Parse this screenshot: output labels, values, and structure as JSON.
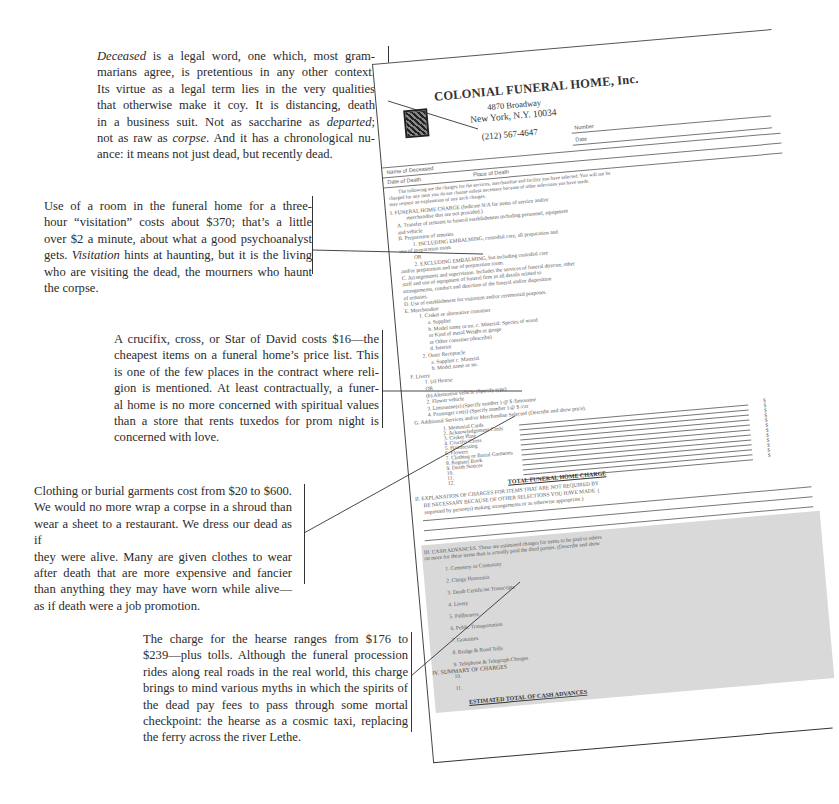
{
  "annotations": [
    {
      "id": "deceased",
      "lines": [
        [
          "<em>Deceased</em> is a legal word, one which, most gram-"
        ],
        [
          "marians agree, is pretentious in any other context."
        ],
        [
          "Its virtue as a legal term lies in the very qualities"
        ],
        [
          "that otherwise make it coy. It is distancing, death"
        ],
        [
          "in a business suit. Not as saccharine as <em>departed</em>;"
        ],
        [
          "not as raw as <em>corpse</em>. And it has a chronological nu-"
        ],
        [
          "ance: it means not just dead, but recently dead."
        ]
      ],
      "text": "Deceased is a legal word, one which, most grammarians agree, is pretentious in any other context. Its virtue as a legal term lies in the very qualities that otherwise make it coy. It is distancing, death in a business suit. Not as saccharine as departed; not as raw as corpse. And it has a chronological nuance: it means not just dead, but recently dead."
    },
    {
      "id": "visitation",
      "lines": [
        [
          "Use of a room in the funeral home for a three-"
        ],
        [
          "hour “visitation” costs about $370; that’s a little"
        ],
        [
          "over $2 a minute, about what a good psychoanalyst"
        ],
        [
          "gets. <em>Visitation</em> hints at haunting, but it is the living"
        ],
        [
          "who are visiting the dead, the mourners who haunt"
        ],
        [
          "the corpse."
        ]
      ],
      "text": "Use of a room in the funeral home for a three-hour “visitation” costs about $370; that’s a little over $2 a minute, about what a good psychoanalyst gets. Visitation hints at haunting, but it is the living who are visiting the dead, the mourners who haunt the corpse."
    },
    {
      "id": "crucifix",
      "lines": [
        [
          "A crucifix, cross, or Star of David costs $16—the"
        ],
        [
          "cheapest items on a funeral home’s price list. This"
        ],
        [
          "is one of the few places in the contract where reli-"
        ],
        [
          "gion is mentioned. At least contractually, a funer-"
        ],
        [
          "al home is no more concerned with spiritual values"
        ],
        [
          "than a store that rents tuxedos for prom night is"
        ],
        [
          "concerned with love."
        ]
      ],
      "text": "A crucifix, cross, or Star of David costs $16—the cheapest items on a funeral home’s price list. This is one of the few places in the contract where religion is mentioned. At least contractually, a funeral home is no more concerned with spiritual values than a store that rents tuxedos for prom night is concerned with love."
    },
    {
      "id": "clothing",
      "lines": [
        [
          "Clothing or burial garments cost from $20 to $600."
        ],
        [
          "We would no more wrap a corpse in a shroud than"
        ],
        [
          "wear a sheet to a restaurant. We dress our dead as if"
        ],
        [
          "they were alive. Many are given clothes to wear"
        ],
        [
          "after death that are more expensive and fancier"
        ],
        [
          "than anything they may have worn while alive—"
        ],
        [
          "as if death were a job promotion."
        ]
      ],
      "text": "Clothing or burial garments cost from $20 to $600. We would no more wrap a corpse in a shroud than wear a sheet to a restaurant. We dress our dead as if they were alive. Many are given clothes to wear after death that are more expensive and fancier than anything they may have worn while alive—as if death were a job promotion."
    },
    {
      "id": "hearse",
      "lines": [
        [
          "The charge for the hearse ranges from $176 to"
        ],
        [
          "$239—plus tolls. Although the funeral procession"
        ],
        [
          "rides along real roads in the real world, this charge"
        ],
        [
          "brings to mind various myths in which the spirits of"
        ],
        [
          "the dead pay fees to pass through some mortal"
        ],
        [
          "checkpoint: the hearse as a cosmic taxi, replacing"
        ],
        [
          "the ferry across the river Lethe."
        ]
      ],
      "text": "The charge for the hearse ranges from $176 to $239—plus tolls. Although the funeral procession rides along real roads in the real world, this charge brings to mind various myths in which the spirits of the dead pay fees to pass through some mortal checkpoint: the hearse as a cosmic taxi, replacing the ferry across the river Lethe."
    }
  ],
  "form": {
    "company": "COLONIAL FUNERAL HOME, Inc.",
    "address1": "4870 Broadway",
    "address2": "New York, N.Y. 10034",
    "phone": "(212) 567-4647",
    "number_label": "Number",
    "date_label": "Date",
    "name_of_deceased_label": "Name of Deceased",
    "date_of_death_label": "Date of Death",
    "place_of_death_label": "Place of Death",
    "intro": [
      "The following are the charges for the services, merchandise and facility you have selected. You will not be",
      "charged for any item you do not choose unless necessary because of other selections you have made.",
      "may request an explanation of any such charges."
    ],
    "section1": {
      "title": "I. FUNERAL HOME CHARGE (Indicate N/A for items of service and/or",
      "title2": "merchandise that are not provided.)",
      "items": [
        "A. Transfer of remains to funeral establishment including personnel, equipment",
        "and vehicle",
        "B. Preparation of remains",
        "1. INCLUDING EMBALMING, custodial care, all preparation and",
        "use of preparation room",
        "OR",
        "2. EXCLUDING EMBALMING, but including custodial care",
        "and/or preparation and use of preparation room.",
        "C. Arrangements and supervision. Includes the services of funeral director, other",
        "staff and use of equipment of funeral firm in all details related to",
        "arrangements, conduct and direction of the funeral and/or disposition",
        "of remains.",
        "D. Use of establishment for visitation and/or ceremonial purposes.",
        "E. Merchandise",
        "1. Casket or alternative container",
        "a. Supplier",
        "b. Model name or no.        c. Material: Species of wood",
        "or Kind of metal                     Weight or gauge",
        "or Other container (describe)",
        "d. Interior",
        "2. Outer Receptacle",
        "a. Supplier                       c. Material",
        "b. Model name or no.",
        "F. Livery",
        "1. (a) Hearse",
        "OR",
        "(b) Alternative vehicle (Specify type)",
        "2. Flower vehicle",
        "3. Limousine(s) (Specify number         ) @ $          /limousine",
        "4. Passenger car(s) (Specify number         ) @ $          /car",
        "G. Additional Services and/or Merchandise Selected (Describe and show price)."
      ],
      "additional": [
        "1. Memorial Cards",
        "2. Acknowledgement Cards",
        "3. Casket Plate",
        "4. Crucifix/Cross",
        "5. Hairdressing",
        "6. Flowers",
        "7. Clothing or Burial Garments",
        "8. Register Book",
        "9. Death Notices",
        "10.",
        "11.",
        "12."
      ],
      "total": "TOTAL FUNERAL HOME CHARGE"
    },
    "section2": [
      "II. EXPLANATION OF CHARGES FOR ITEMS THAT ARE NOT REQUIRED BY",
      "BE NECESSARY BECAUSE OF OTHER SELECTIONS YOU HAVE MADE. (",
      "requested by person(s) making arrangements or as otherwise appropriate.)"
    ],
    "section3": {
      "title": "III. CASH ADVANCES. These are estimated charges for items to be paid to others",
      "title2": "on more for these items than is actually paid the third parties. (Describe and show",
      "items": [
        "1. Cemetery or Crematory",
        "2. Clergy Honoraria",
        "3. Death Certificate Transcripts",
        "4. Livery",
        "5. Pallbearers",
        "6. Public Transportation",
        "7. Gratuities",
        "8. Bridge & Road Tolls",
        "9. Telephone & Telegraph Charges",
        "10.",
        "11."
      ],
      "total": "ESTIMATED TOTAL OF CASH ADVANCES"
    },
    "section4": {
      "title": "IV. SUMMARY OF CHARGES",
      "items": [
        "Funeral Home Charge",
        "Estimated Cash Advances"
      ],
      "total": "TOTAL FUNERAL CHARGES"
    },
    "footer": {
      "not_a_bill": "THIS IS NOT A BILL",
      "terms1": "TERMS: This account becomes due",
      "terms2": "a late charge of        % per month (annual rate",
      "terms3": "unpaid portion of the balance due",
      "statement": "The foregoing statement has been read by (to) me and I hereby acknowledge",
      "relation": "Relation",
      "signature": "Signature",
      "by": "By",
      "form_code": "1984 © AF-FCS-4D",
      "print": "Print",
      "if": "If",
      "dat": "Dat"
    },
    "dollar_sign": "$"
  }
}
